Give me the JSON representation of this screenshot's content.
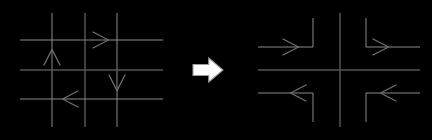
{
  "figure": {
    "name": "grid-to-intersection-transformation",
    "background_color": "#ffffff",
    "width": 432,
    "height": 140,
    "line_color_light": "#8a8a8a",
    "line_color_dark": "#555555",
    "arrow_color": "#707070",
    "block_arrow_stroke": "#9a9a9a",
    "block_arrow_fill": "#ffffff"
  },
  "left_panel": {
    "name": "grid-network",
    "description": "three-by-three street grid with one-way direction arrows",
    "vertical_roads": [
      {
        "id": "v1",
        "x": 52,
        "y_top": 13,
        "y_bottom": 127,
        "weight": "light"
      },
      {
        "id": "v2",
        "x": 85,
        "y_top": 13,
        "y_bottom": 127,
        "weight": "dark"
      },
      {
        "id": "v3",
        "x": 117,
        "y_top": 13,
        "y_bottom": 127,
        "weight": "light"
      }
    ],
    "horizontal_roads": [
      {
        "id": "h1",
        "y": 40,
        "x_left": 20,
        "x_right": 163,
        "weight": "light"
      },
      {
        "id": "h2",
        "y": 70,
        "x_left": 20,
        "x_right": 163,
        "weight": "dark"
      },
      {
        "id": "h3",
        "y": 99,
        "x_left": 20,
        "x_right": 163,
        "weight": "light"
      }
    ],
    "flow_arrows": [
      {
        "id": "arrow-up",
        "direction": "up",
        "x": 52,
        "y": 55,
        "label": "northbound"
      },
      {
        "id": "arrow-right",
        "direction": "right",
        "x": 103,
        "y": 40,
        "label": "eastbound"
      },
      {
        "id": "arrow-down",
        "direction": "down",
        "x": 117,
        "y": 85,
        "label": "southbound"
      },
      {
        "id": "arrow-left",
        "direction": "left",
        "x": 68,
        "y": 99,
        "label": "westbound"
      }
    ]
  },
  "transform_arrow": {
    "name": "block-arrow-right",
    "glyph": "rightwards-block-arrow",
    "direction": "right",
    "center_x": 208,
    "center_y": 70,
    "width": 30,
    "height": 24
  },
  "right_panel": {
    "name": "consolidated-intersection",
    "description": "single cross intersection with four L-shaped approach legs",
    "center": {
      "x": 340,
      "y": 70
    },
    "cross": {
      "vertical": {
        "x": 340,
        "y_top": 13,
        "y_bottom": 127,
        "weight": "dark"
      },
      "horizontal": {
        "y": 70,
        "x_left": 258,
        "x_right": 420,
        "weight": "dark"
      }
    },
    "legs": [
      {
        "id": "leg-top-left",
        "quadrant": "top-left",
        "path": "enters from west, turns north",
        "arrow_direction": "right",
        "arrow_x": 293,
        "arrow_y": 47,
        "corner_x": 313,
        "corner_y": 47,
        "end_x": 258,
        "end_y": 18
      },
      {
        "id": "leg-top-right",
        "quadrant": "top-right",
        "path": "enters from north, turns east",
        "arrow_direction": "right",
        "arrow_x": 383,
        "arrow_y": 47,
        "corner_x": 366,
        "corner_y": 47,
        "end_x": 420,
        "end_y": 18
      },
      {
        "id": "leg-bottom-left",
        "quadrant": "bottom-left",
        "path": "enters from south, turns west",
        "arrow_direction": "left",
        "arrow_x": 296,
        "arrow_y": 93,
        "corner_x": 313,
        "corner_y": 93,
        "end_x": 258,
        "end_y": 122
      },
      {
        "id": "leg-bottom-right",
        "quadrant": "bottom-right",
        "path": "enters from east, turns south",
        "arrow_direction": "left",
        "arrow_x": 386,
        "arrow_y": 93,
        "corner_x": 366,
        "corner_y": 93,
        "end_x": 420,
        "end_y": 122
      }
    ]
  }
}
